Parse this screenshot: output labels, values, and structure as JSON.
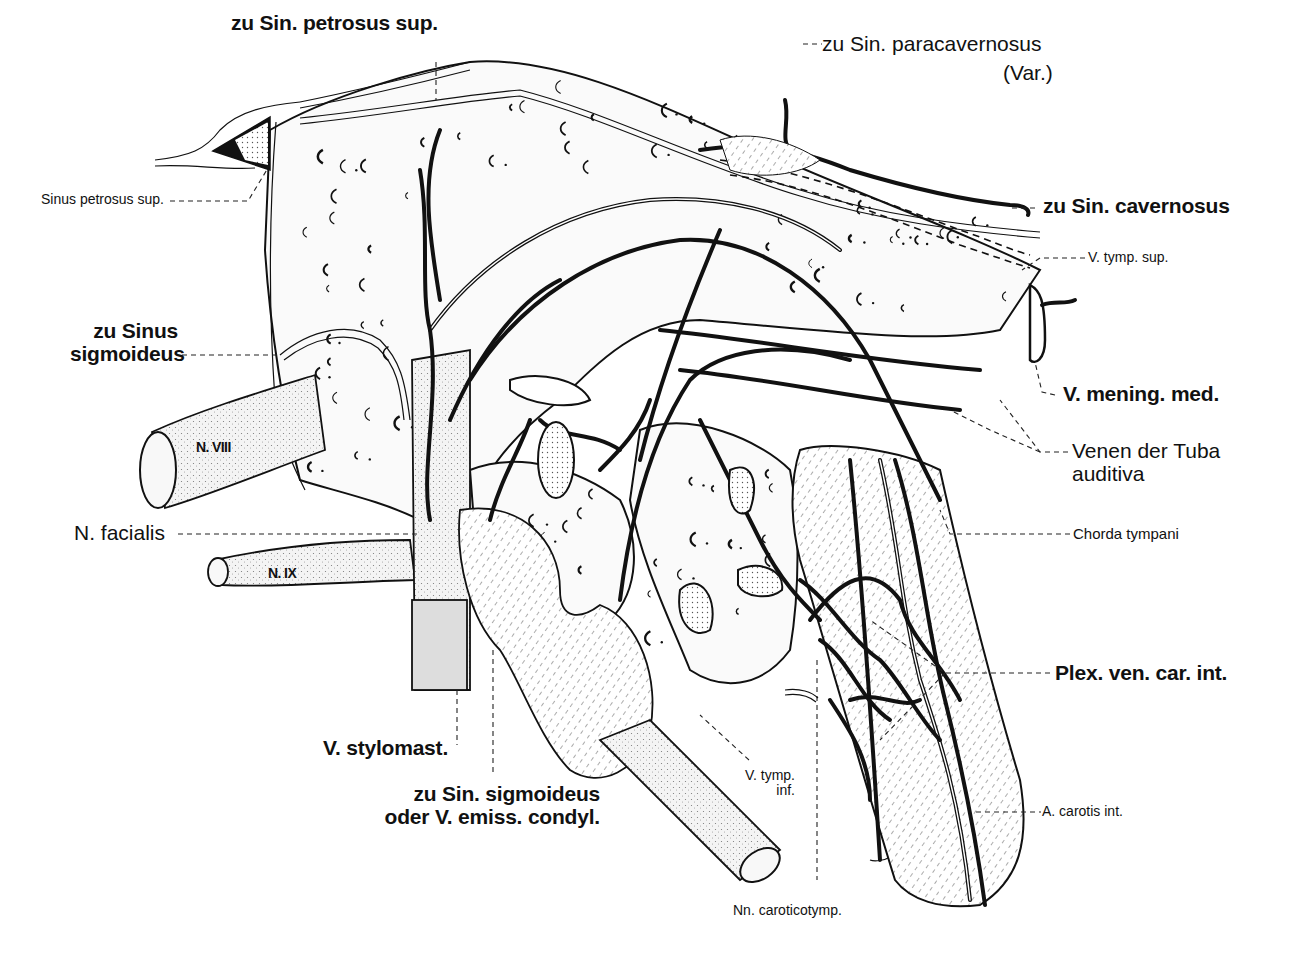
{
  "figure": {
    "labels": {
      "zu_sin_petrosus_sup": "zu Sin. petrosus sup.",
      "zu_sin_paracavernosus_line1": "zu Sin. paracavernosus",
      "zu_sin_paracavernosus_line2": "(Var.)",
      "sinus_petrosus_sup": "Sinus petrosus sup.",
      "zu_sin_cavernosus": "zu Sin. cavernosus",
      "v_tymp_sup": "V. tymp. sup.",
      "zu_sinus_sigmoideus_line1": "zu Sinus",
      "zu_sinus_sigmoideus_line2": "sigmoideus",
      "v_mening_med": "V. mening. med.",
      "n_viii": "N. VIII",
      "venen_tuba_line1": "Venen der Tuba",
      "venen_tuba_line2": "auditiva",
      "n_facialis": "N. facialis",
      "chorda_tympani": "Chorda tympani",
      "n_ix": "N. IX",
      "plex_ven_car_int": "Plex. ven. car. int.",
      "v_stylomast": "V. stylomast.",
      "v_tymp_inf_line1": "V. tymp.",
      "v_tymp_inf_line2": "inf.",
      "zu_sin_sigmoideus_cond_line1": "zu Sin. sigmoideus",
      "zu_sin_sigmoideus_cond_line2": "oder V. emiss. condyl.",
      "a_carotis_int": "A. carotis int.",
      "nn_caroticotymp": "Nn. caroticotymp."
    }
  }
}
